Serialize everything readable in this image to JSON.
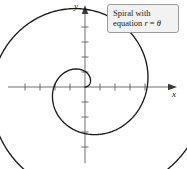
{
  "figure": {
    "kind": "polar-graph",
    "background_color": "#ffffff",
    "curve_color": "#1a1a1a",
    "axis_color": "#6e6e6e"
  },
  "callout": {
    "line1": "Spiral with",
    "line2_prefix": "equation ",
    "line2_var_r": "r",
    "line2_equals": " = ",
    "line2_var_theta": "θ",
    "background_color": "#f2f2f2",
    "border_color": "#9a9a9a"
  },
  "axes": {
    "x_label": "x",
    "y_label": "y",
    "origin_x": 85,
    "origin_y": 87,
    "tick_spacing": 15,
    "x_ticks_left": [
      70,
      55,
      40,
      25
    ],
    "x_ticks_right": [
      100,
      115,
      130,
      145
    ],
    "y_ticks_up": [
      72,
      57,
      42,
      27
    ],
    "y_ticks_down": [
      102,
      117,
      132,
      147
    ],
    "x_axis_start": 8,
    "x_axis_end": 172,
    "y_axis_top": 10,
    "y_axis_bottom": 163
  },
  "chart_data": {
    "type": "line",
    "title": "Spiral with equation r = θ",
    "xlabel": "x",
    "ylabel": "y",
    "equation": "r = θ",
    "coordinate_system": "polar",
    "theta_min": 0,
    "theta_max": 12.566,
    "r_scale_px_per_unit": 9.9,
    "grid": false,
    "legend": "none",
    "annotations": [
      "Spiral with equation r = θ"
    ],
    "series": [
      {
        "name": "r = theta",
        "description": "Archimedean spiral traced counterclockwise from the origin through two full revolutions, ending on the negative x-axis.",
        "polar_points": [
          {
            "theta": 0.0,
            "r": 0.0
          },
          {
            "theta": 0.785,
            "r": 0.785
          },
          {
            "theta": 1.571,
            "r": 1.571
          },
          {
            "theta": 2.356,
            "r": 2.356
          },
          {
            "theta": 3.142,
            "r": 3.142
          },
          {
            "theta": 3.927,
            "r": 3.927
          },
          {
            "theta": 4.712,
            "r": 4.712
          },
          {
            "theta": 5.498,
            "r": 5.498
          },
          {
            "theta": 6.283,
            "r": 6.283
          },
          {
            "theta": 7.069,
            "r": 7.069
          },
          {
            "theta": 7.854,
            "r": 7.854
          },
          {
            "theta": 8.639,
            "r": 8.639
          },
          {
            "theta": 9.425,
            "r": 9.425
          },
          {
            "theta": 10.21,
            "r": 10.21
          },
          {
            "theta": 10.996,
            "r": 10.996
          },
          {
            "theta": 11.781,
            "r": 11.781
          },
          {
            "theta": 12.566,
            "r": 12.566
          }
        ]
      }
    ]
  }
}
